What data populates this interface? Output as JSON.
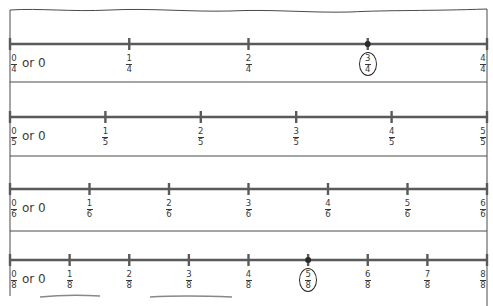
{
  "colors": {
    "line": "#5a5a5a",
    "border": "#4a4a4a",
    "text": "#3a3a3a",
    "dot": "#2a2a2a"
  },
  "zero_suffix": "or 0",
  "chart_data": {
    "type": "number-line",
    "title": "",
    "number_lines": [
      {
        "denominator": 4,
        "ticks": [
          "0/4",
          "1/4",
          "2/4",
          "3/4",
          "4/4"
        ],
        "zero_label": "0/4 or 0",
        "highlighted": "3/4",
        "highlighted_value": 0.75
      },
      {
        "denominator": 5,
        "ticks": [
          "0/5",
          "1/5",
          "2/5",
          "3/5",
          "4/5",
          "5/5"
        ],
        "zero_label": "0/5 or 0",
        "highlighted": null
      },
      {
        "denominator": 6,
        "ticks": [
          "0/6",
          "1/6",
          "2/6",
          "3/6",
          "4/6",
          "5/6",
          "6/6"
        ],
        "zero_label": "0/6 or 0",
        "highlighted": null
      },
      {
        "denominator": 8,
        "ticks": [
          "0/8",
          "1/8",
          "2/8",
          "3/8",
          "4/8",
          "5/8",
          "6/8",
          "7/8",
          "8/8"
        ],
        "zero_label": "0/8 or 0",
        "highlighted": "5/8",
        "highlighted_value": 0.625
      }
    ],
    "range": [
      0,
      1
    ]
  },
  "rows": [
    {
      "den": 4,
      "line_y": 44,
      "label_y": 54,
      "highlight": 3
    },
    {
      "den": 5,
      "line_y": 117,
      "label_y": 127,
      "highlight": null
    },
    {
      "den": 6,
      "line_y": 189,
      "label_y": 199,
      "highlight": null
    },
    {
      "den": 8,
      "line_y": 260,
      "label_y": 270,
      "highlight": 5
    }
  ],
  "separators_y": [
    82,
    156,
    231
  ],
  "frame": {
    "left": 10,
    "right": 487
  }
}
